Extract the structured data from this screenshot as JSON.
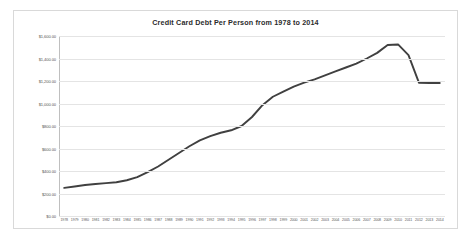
{
  "chart_data": {
    "type": "line",
    "title": "Credit Card Debt Per Person from 1978 to 2014",
    "xlabel": "",
    "ylabel": "",
    "grid": true,
    "legend": false,
    "line_color": "#404040",
    "categories": [
      "1978",
      "1979",
      "1980",
      "1981",
      "1982",
      "1983",
      "1984",
      "1985",
      "1986",
      "1987",
      "1988",
      "1989",
      "1990",
      "1991",
      "1992",
      "1993",
      "1994",
      "1995",
      "1996",
      "1997",
      "1998",
      "1999",
      "2000",
      "2001",
      "2002",
      "2003",
      "2004",
      "2005",
      "2006",
      "2007",
      "2008",
      "2009",
      "2010",
      "2011",
      "2012",
      "2013",
      "2014"
    ],
    "values": [
      250,
      262,
      275,
      285,
      292,
      300,
      318,
      345,
      390,
      440,
      500,
      560,
      620,
      672,
      710,
      740,
      762,
      800,
      880,
      985,
      1060,
      1105,
      1150,
      1185,
      1215,
      1250,
      1285,
      1320,
      1355,
      1400,
      1450,
      1520,
      1525,
      1430,
      1185,
      1182,
      1182
    ],
    "ylim": [
      0,
      1600
    ],
    "ytick_values": [
      0,
      200,
      400,
      600,
      800,
      1000,
      1200,
      1400,
      1600
    ],
    "ytick_labels": [
      "$0.00",
      "$200.00",
      "$400.00",
      "$600.00",
      "$800.00",
      "$1,000.00",
      "$1,200.00",
      "$1,400.00",
      "$1,600.00"
    ]
  }
}
